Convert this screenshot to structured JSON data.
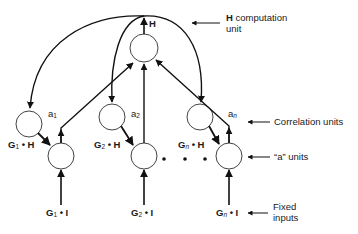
{
  "diagram": {
    "h_unit": {
      "output_label": "H"
    },
    "columns": [
      {
        "a_label": "a",
        "a_sub": "1",
        "gh_label_G": "G",
        "gh_sub": "1",
        "gh_label_H": " • H",
        "gi_label_G": "G",
        "gi_sub": "1",
        "gi_label_I": " • I"
      },
      {
        "a_label": "a",
        "a_sub": "2",
        "gh_label_G": "G",
        "gh_sub": "2",
        "gh_label_H": " • H",
        "gi_label_G": "G",
        "gi_sub": "2",
        "gi_label_I": " • I"
      },
      {
        "a_label": "a",
        "a_sub": "n",
        "gh_label_G": "G",
        "gh_sub": "n",
        "gh_label_H": " • H",
        "gi_label_G": "G",
        "gi_sub": "n",
        "gi_label_I": " • I"
      }
    ],
    "ellipsis": "• • •",
    "annotations": {
      "h_computation_bold": "H",
      "h_computation_rest": " computation",
      "h_computation_line2": "unit",
      "correlation_units": "Correlation units",
      "a_units": "“a” units",
      "fixed_inputs_line1": "Fixed",
      "fixed_inputs_line2": "inputs"
    },
    "colors": {
      "line": "#111111",
      "circle_stroke": "#444444",
      "background": "#ffffff"
    }
  }
}
